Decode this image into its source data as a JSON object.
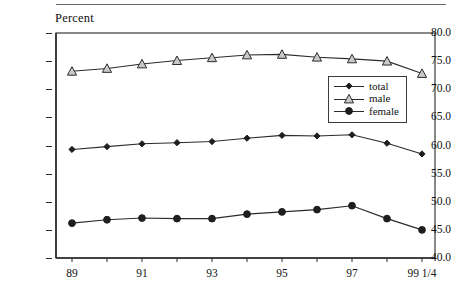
{
  "axis_title": "Percent",
  "legend": {
    "position": "inside-right-upper",
    "items": [
      {
        "label": "total",
        "marker": "diamond-filled-icon"
      },
      {
        "label": "male",
        "marker": "triangle-open-icon"
      },
      {
        "label": "female",
        "marker": "circle-filled-icon"
      }
    ]
  },
  "colors": {
    "line": "#2b2b2b",
    "axis": "#2b2b2b",
    "frame": "#3a3a3a",
    "triangle_fill": "#c9c9c9",
    "marker_dark": "#1e1e1e",
    "background": "#ffffff",
    "text": "#111111"
  },
  "chart_data": {
    "type": "line",
    "title": "",
    "subtitle": "",
    "xlabel": "",
    "ylabel": "Percent",
    "ylim": [
      40.0,
      80.0
    ],
    "ytick_step": 5.0,
    "yticks": [
      "40.0",
      "45.0",
      "50.0",
      "55.0",
      "60.0",
      "65.0",
      "70.0",
      "75.0",
      "80.0"
    ],
    "grid": false,
    "legend_position": "inside right upper",
    "x": [
      "89",
      "90",
      "91",
      "92",
      "93",
      "94",
      "95",
      "96",
      "97",
      "98",
      "99 1/4"
    ],
    "xtick_labels": [
      {
        "index": 0,
        "label": "89"
      },
      {
        "index": 1,
        "label": ""
      },
      {
        "index": 2,
        "label": "91"
      },
      {
        "index": 3,
        "label": ""
      },
      {
        "index": 4,
        "label": "93"
      },
      {
        "index": 5,
        "label": ""
      },
      {
        "index": 6,
        "label": "95"
      },
      {
        "index": 7,
        "label": ""
      },
      {
        "index": 8,
        "label": "97"
      },
      {
        "index": 9,
        "label": ""
      },
      {
        "index": 10,
        "label": "99 1/4"
      }
    ],
    "series": [
      {
        "name": "male",
        "marker": "triangle",
        "values": [
          73.2,
          73.7,
          74.5,
          75.1,
          75.6,
          76.1,
          76.2,
          75.7,
          75.4,
          75.0,
          72.8
        ]
      },
      {
        "name": "total",
        "marker": "diamond",
        "values": [
          59.3,
          59.8,
          60.3,
          60.5,
          60.7,
          61.3,
          61.8,
          61.7,
          61.9,
          60.4,
          58.5
        ]
      },
      {
        "name": "female",
        "marker": "circle",
        "values": [
          46.2,
          46.8,
          47.1,
          47.0,
          47.0,
          47.8,
          48.2,
          48.6,
          49.3,
          47.0,
          45.0
        ]
      }
    ]
  }
}
